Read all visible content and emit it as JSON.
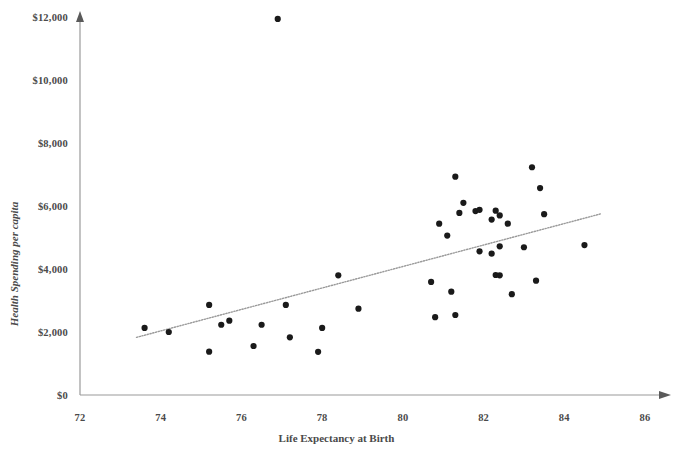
{
  "chart_data": {
    "type": "scatter",
    "title": "",
    "xlabel": "Life Expectancy at Birth",
    "ylabel": "Health Spending per capita",
    "xlim": [
      72,
      86
    ],
    "ylim": [
      0,
      12000
    ],
    "xticks": [
      "72",
      "74",
      "76",
      "78",
      "80",
      "82",
      "84",
      "86"
    ],
    "xtick_values": [
      72,
      74,
      76,
      78,
      80,
      82,
      84,
      86
    ],
    "yticks": [
      "$0",
      "$2,000",
      "$4,000",
      "$6,000",
      "$8,000",
      "$10,000",
      "$12,000"
    ],
    "ytick_values": [
      0,
      2000,
      4000,
      6000,
      8000,
      10000,
      12000
    ],
    "grid": false,
    "legend": "none",
    "marker_color": "#1a1a1a",
    "axis_color": "#8a8a8a",
    "trendline_color": "#9a9a9a",
    "trendline_style": "dotted",
    "trendline": {
      "x0": 73.4,
      "y0": 1830,
      "x1": 84.9,
      "y1": 5750
    },
    "points": [
      {
        "x": 76.9,
        "y": 11940
      },
      {
        "x": 73.6,
        "y": 2130
      },
      {
        "x": 74.2,
        "y": 2000
      },
      {
        "x": 75.2,
        "y": 2860
      },
      {
        "x": 75.2,
        "y": 1375
      },
      {
        "x": 75.5,
        "y": 2230
      },
      {
        "x": 75.7,
        "y": 2360
      },
      {
        "x": 76.5,
        "y": 2230
      },
      {
        "x": 76.3,
        "y": 1555
      },
      {
        "x": 77.1,
        "y": 2860
      },
      {
        "x": 77.2,
        "y": 1830
      },
      {
        "x": 78.0,
        "y": 2130
      },
      {
        "x": 77.9,
        "y": 1370
      },
      {
        "x": 78.4,
        "y": 3800
      },
      {
        "x": 78.9,
        "y": 2740
      },
      {
        "x": 80.7,
        "y": 3590
      },
      {
        "x": 81.2,
        "y": 3280
      },
      {
        "x": 80.8,
        "y": 2470
      },
      {
        "x": 81.3,
        "y": 2540
      },
      {
        "x": 80.9,
        "y": 5440
      },
      {
        "x": 81.1,
        "y": 5060
      },
      {
        "x": 81.3,
        "y": 6930
      },
      {
        "x": 81.5,
        "y": 6100
      },
      {
        "x": 81.4,
        "y": 5780
      },
      {
        "x": 81.8,
        "y": 5840
      },
      {
        "x": 81.9,
        "y": 5880
      },
      {
        "x": 82.3,
        "y": 5850
      },
      {
        "x": 82.4,
        "y": 5700
      },
      {
        "x": 82.2,
        "y": 5570
      },
      {
        "x": 82.6,
        "y": 5440
      },
      {
        "x": 82.4,
        "y": 4720
      },
      {
        "x": 81.9,
        "y": 4560
      },
      {
        "x": 82.2,
        "y": 4490
      },
      {
        "x": 82.3,
        "y": 3810
      },
      {
        "x": 82.4,
        "y": 3800
      },
      {
        "x": 82.7,
        "y": 3200
      },
      {
        "x": 83.2,
        "y": 7230
      },
      {
        "x": 83.4,
        "y": 6570
      },
      {
        "x": 83.5,
        "y": 5740
      },
      {
        "x": 83.0,
        "y": 4690
      },
      {
        "x": 83.3,
        "y": 3630
      },
      {
        "x": 84.5,
        "y": 4760
      }
    ]
  },
  "axis_titles": {
    "x": "Life Expectancy at Birth",
    "y": "Health Spending per capita"
  }
}
